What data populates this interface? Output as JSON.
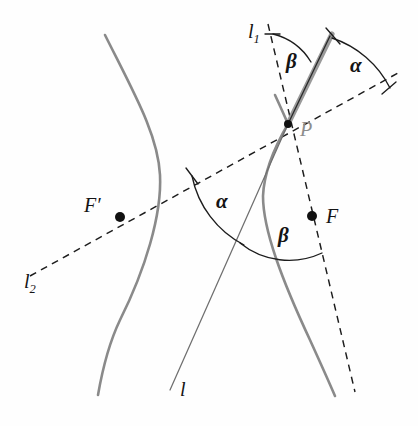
{
  "figure": {
    "background_color": "#fefefe",
    "curve_color": "#8a8a8a",
    "dash_color": "#1c1c1c",
    "point_label_color_P": "#8d8d8d"
  },
  "labels": {
    "l1": "l",
    "l1_sub": "1",
    "l2": "l",
    "l2_sub": "2",
    "l": "l",
    "P": "P",
    "F": "F",
    "F_prime": "F′",
    "alpha_top": "α",
    "alpha_mid": "α",
    "beta_top": "β",
    "beta_low": "β"
  },
  "points": [
    {
      "name": "P",
      "label": "P",
      "x": 288,
      "y": 124,
      "radius": 4.0,
      "filled": true
    },
    {
      "name": "F",
      "label": "F",
      "x": 312,
      "y": 216,
      "radius": 5.0,
      "filled": true
    },
    {
      "name": "F-prime",
      "label": "F′",
      "x": 120,
      "y": 217,
      "radius": 5.0,
      "filled": true
    }
  ],
  "label_positions": {
    "l1": {
      "x": 248,
      "y": 38
    },
    "l2": {
      "x": 24,
      "y": 288
    },
    "l": {
      "x": 180,
      "y": 396
    },
    "P": {
      "x": 300,
      "y": 136
    },
    "F": {
      "x": 326,
      "y": 222
    },
    "F_prime": {
      "x": 86,
      "y": 212
    },
    "alpha_top": {
      "x": 357,
      "y": 70
    },
    "alpha_mid": {
      "x": 222,
      "y": 205
    },
    "beta_top": {
      "x": 291,
      "y": 65
    },
    "beta_low": {
      "x": 283,
      "y": 238
    }
  },
  "geometry": {
    "left_branch_path": "M 105 35 C 135 95, 158 135, 160 175 C 162 215, 145 270, 120 320 C 108 345, 102 372, 98 395",
    "right_branch_path": "M 275 95 C 281 108, 285 117, 288 124 C 274 148, 264 172, 263 196 C 263 230, 282 280, 310 340 C 320 362, 329 382, 335 396",
    "asymptote_l_path": "M 288 124 L 170 390",
    "dashed_l2_path": "M 30 276 L 398 73",
    "dashed_l1_path": "M 268 24 L 355 392",
    "tangent_path": "M 288 124 L 332 34",
    "tangent_core_path": "M 288 124 L 330 36"
  },
  "arcs": {
    "alpha_top": {
      "path": "M 332 38 A 100 100 0 0 1 390 88",
      "tick1": "M 326 28 L 340 44",
      "tick2": "M 382 94 L 396 82"
    },
    "beta_top": {
      "path": "M 273 34 A 62 62 0 0 1 311 62",
      "tick1": "M 265 34 L 280 34"
    },
    "alpha_mid": {
      "path": "M 192 176 A 100 100 0 0 0 244 245",
      "tick1": "M 186 168 L 198 184"
    },
    "beta_low": {
      "path": "M 240 243 A 78 78 0 0 0 322 253",
      "tick1": ""
    }
  },
  "angles": {
    "alpha_description": "angle between tangent at P and line PF′ (l₂)",
    "beta_description": "angle between tangent at P and line PF (l₁)",
    "relation": "α = β"
  }
}
